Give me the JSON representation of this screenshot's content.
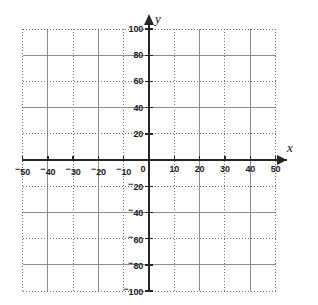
{
  "figure": {
    "kind": "cartesian-coordinate-grid",
    "background_color": "#ffffff",
    "axis_color": "#262626",
    "grid_solid_color": "#8c8c8c",
    "grid_dotted_color": "#6e6e6e"
  },
  "axes": {
    "x_axis_name": "x",
    "y_axis_name": "y",
    "origin_label": "0"
  },
  "chart_data": {
    "type": "scatter",
    "title": "",
    "xlabel": "x",
    "ylabel": "y",
    "xlim": [
      -50,
      50
    ],
    "ylim": [
      -100,
      100
    ],
    "grid": true,
    "legend": "none",
    "x_major_step": 10,
    "y_major_step": 20,
    "x_tick_values": [
      -50,
      -40,
      -30,
      -20,
      -10,
      0,
      10,
      20,
      30,
      40,
      50
    ],
    "y_tick_values": [
      -100,
      -80,
      -60,
      -40,
      -20,
      20,
      40,
      60,
      80,
      100
    ],
    "x_tick_labels": [
      "⁻50",
      "⁻40",
      "⁻30",
      "⁻20",
      "⁻10",
      "0",
      "10",
      "20",
      "30",
      "40",
      "50"
    ],
    "y_tick_labels": [
      "⁻100",
      "⁻80",
      "⁻60",
      "⁻40",
      "⁻20",
      "20",
      "40",
      "60",
      "80",
      "100"
    ],
    "series": [],
    "values": [],
    "categories": [],
    "annotations": []
  },
  "x_ticks": [
    {
      "value": -50,
      "sign": "⁻",
      "digits": "50"
    },
    {
      "value": -40,
      "sign": "⁻",
      "digits": "40"
    },
    {
      "value": -30,
      "sign": "⁻",
      "digits": "30"
    },
    {
      "value": -20,
      "sign": "⁻",
      "digits": "20"
    },
    {
      "value": -10,
      "sign": "⁻",
      "digits": "10"
    },
    {
      "value": 0,
      "sign": "",
      "digits": "0"
    },
    {
      "value": 10,
      "sign": "",
      "digits": "10"
    },
    {
      "value": 20,
      "sign": "",
      "digits": "20"
    },
    {
      "value": 30,
      "sign": "",
      "digits": "30"
    },
    {
      "value": 40,
      "sign": "",
      "digits": "40"
    },
    {
      "value": 50,
      "sign": "",
      "digits": "50"
    }
  ],
  "y_ticks": [
    {
      "value": 100,
      "sign": "",
      "digits": "100"
    },
    {
      "value": 80,
      "sign": "",
      "digits": "80"
    },
    {
      "value": 60,
      "sign": "",
      "digits": "60"
    },
    {
      "value": 40,
      "sign": "",
      "digits": "40"
    },
    {
      "value": 20,
      "sign": "",
      "digits": "20"
    },
    {
      "value": -20,
      "sign": "⁻",
      "digits": "20"
    },
    {
      "value": -40,
      "sign": "⁻",
      "digits": "40"
    },
    {
      "value": -60,
      "sign": "⁻",
      "digits": "60"
    },
    {
      "value": -80,
      "sign": "⁻",
      "digits": "80"
    },
    {
      "value": -100,
      "sign": "⁻",
      "digits": "100"
    }
  ],
  "gridlines": {
    "vertical": [
      {
        "value": -50,
        "style": "dotted"
      },
      {
        "value": -40,
        "style": "solid"
      },
      {
        "value": -30,
        "style": "dotted"
      },
      {
        "value": -20,
        "style": "solid"
      },
      {
        "value": -10,
        "style": "dotted"
      },
      {
        "value": 10,
        "style": "dotted"
      },
      {
        "value": 20,
        "style": "solid"
      },
      {
        "value": 30,
        "style": "dotted"
      },
      {
        "value": 40,
        "style": "solid"
      },
      {
        "value": 50,
        "style": "dotted"
      }
    ],
    "horizontal": [
      {
        "value": 100,
        "style": "dotted"
      },
      {
        "value": 80,
        "style": "solid"
      },
      {
        "value": 60,
        "style": "dotted"
      },
      {
        "value": 40,
        "style": "solid"
      },
      {
        "value": 20,
        "style": "dotted"
      },
      {
        "value": -20,
        "style": "dotted"
      },
      {
        "value": -40,
        "style": "solid"
      },
      {
        "value": -60,
        "style": "dotted"
      },
      {
        "value": -80,
        "style": "solid"
      },
      {
        "value": -100,
        "style": "dotted"
      }
    ]
  }
}
